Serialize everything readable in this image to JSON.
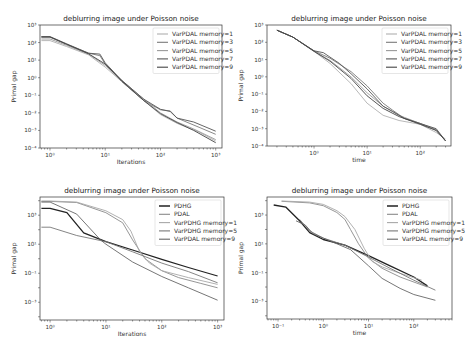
{
  "figure": {
    "width": 466,
    "height": 352
  },
  "chart_data": [
    {
      "id": "top-left",
      "type": "line",
      "title": "deblurring image under Poisson noise",
      "xlabel": "Iterations",
      "ylabel": "Primal gap",
      "xscale": "log",
      "yscale": "log",
      "xlim": [
        0.66,
        1300
      ],
      "ylim": [
        0.0001,
        1000
      ],
      "xticks": [
        {
          "v": 1,
          "label": "10⁰"
        },
        {
          "v": 10,
          "label": "10¹"
        },
        {
          "v": 100,
          "label": "10²"
        },
        {
          "v": 1000,
          "label": "10³"
        }
      ],
      "yticks": [
        {
          "v": 1000,
          "label": "10³"
        },
        {
          "v": 100,
          "label": "10²"
        },
        {
          "v": 10,
          "label": "10¹"
        },
        {
          "v": 1,
          "label": "10⁰"
        },
        {
          "v": 0.1,
          "label": "10⁻¹"
        },
        {
          "v": 0.01,
          "label": "10⁻²"
        },
        {
          "v": 0.001,
          "label": "10⁻³"
        },
        {
          "v": 0.0001,
          "label": "10⁻⁴"
        }
      ],
      "grid": false,
      "legend_position": "upper right",
      "series": [
        {
          "name": "VarPDAL memory=1",
          "color": "#b0b0b0",
          "width": 0.9,
          "x": [
            0.7,
            1,
            2,
            5,
            10,
            20,
            50,
            100,
            200,
            500,
            1000
          ],
          "y": [
            130,
            130,
            60,
            20,
            4,
            0.6,
            0.05,
            0.008,
            0.0025,
            0.0008,
            0.00025
          ]
        },
        {
          "name": "VarPDAL memory=3",
          "color": "#7a7a7a",
          "width": 0.9,
          "x": [
            0.7,
            1,
            2,
            5,
            8,
            10,
            20,
            50,
            100,
            150,
            200,
            500,
            1000
          ],
          "y": [
            200,
            200,
            80,
            25,
            18,
            6,
            0.6,
            0.05,
            0.015,
            0.013,
            0.005,
            0.0015,
            0.0006
          ]
        },
        {
          "name": "VarPDAL memory=5",
          "color": "#999999",
          "width": 0.9,
          "x": [
            0.7,
            1,
            2,
            5,
            10,
            20,
            50,
            100,
            200,
            400,
            1000
          ],
          "y": [
            160,
            160,
            70,
            22,
            5,
            0.7,
            0.06,
            0.01,
            0.003,
            0.0012,
            0.0003
          ]
        },
        {
          "name": "VarPDAL memory=7",
          "color": "#555555",
          "width": 0.9,
          "x": [
            0.7,
            1,
            2,
            5,
            8,
            10,
            20,
            50,
            100,
            150,
            200,
            400,
            1000
          ],
          "y": [
            220,
            220,
            85,
            25,
            22,
            7,
            0.7,
            0.06,
            0.016,
            0.012,
            0.005,
            0.003,
            0.0009
          ]
        },
        {
          "name": "VarPDAL memory=9",
          "color": "#444444",
          "width": 0.9,
          "x": [
            0.7,
            1,
            2,
            5,
            10,
            20,
            50,
            100,
            200,
            400,
            1000
          ],
          "y": [
            210,
            210,
            80,
            23,
            6,
            0.65,
            0.05,
            0.009,
            0.0028,
            0.001,
            0.0002
          ]
        }
      ]
    },
    {
      "id": "top-right",
      "type": "line",
      "title": "deblurring image under Poisson noise",
      "xlabel": "time",
      "ylabel": "Primal gap",
      "xscale": "log",
      "yscale": "log",
      "xlim": [
        0.13,
        380
      ],
      "ylim": [
        0.0001,
        1000
      ],
      "xticks": [
        {
          "v": 1,
          "label": "10⁰"
        },
        {
          "v": 10,
          "label": "10¹"
        },
        {
          "v": 100,
          "label": "10²"
        }
      ],
      "yticks": [
        {
          "v": 1000,
          "label": "10³"
        },
        {
          "v": 100,
          "label": "10²"
        },
        {
          "v": 10,
          "label": "10¹"
        },
        {
          "v": 1,
          "label": "10⁰"
        },
        {
          "v": 0.1,
          "label": "10⁻¹"
        },
        {
          "v": 0.01,
          "label": "10⁻²"
        },
        {
          "v": 0.001,
          "label": "10⁻³"
        },
        {
          "v": 0.0001,
          "label": "10⁻⁴"
        }
      ],
      "grid": false,
      "legend_position": "upper right",
      "series": [
        {
          "name": "VarPDAL memory=1",
          "color": "#b0b0b0",
          "width": 0.9,
          "x": [
            0.2,
            0.4,
            1,
            2,
            5,
            10,
            20,
            40,
            100,
            200,
            300
          ],
          "y": [
            500,
            200,
            30,
            6,
            0.4,
            0.03,
            0.006,
            0.003,
            0.0018,
            0.0006,
            0.00025
          ]
        },
        {
          "name": "VarPDAL memory=3",
          "color": "#7a7a7a",
          "width": 0.9,
          "x": [
            0.2,
            0.4,
            1,
            2,
            5,
            10,
            20,
            30,
            50,
            100,
            200,
            300
          ],
          "y": [
            500,
            200,
            32,
            12,
            2,
            0.3,
            0.03,
            0.012,
            0.004,
            0.002,
            0.0008,
            0.0002
          ]
        },
        {
          "name": "VarPDAL memory=5",
          "color": "#999999",
          "width": 0.9,
          "x": [
            0.2,
            0.4,
            1,
            2,
            5,
            10,
            20,
            40,
            100,
            200,
            300
          ],
          "y": [
            500,
            200,
            30,
            9,
            1,
            0.12,
            0.02,
            0.006,
            0.002,
            0.0009,
            0.0002
          ]
        },
        {
          "name": "VarPDAL memory=7",
          "color": "#555555",
          "width": 0.9,
          "x": [
            0.2,
            0.4,
            1,
            1.5,
            3,
            5,
            10,
            20,
            30,
            50,
            100,
            200,
            300
          ],
          "y": [
            500,
            200,
            32,
            25,
            6,
            1.5,
            0.2,
            0.02,
            0.01,
            0.004,
            0.002,
            0.001,
            0.0002
          ]
        },
        {
          "name": "VarPDAL memory=9",
          "color": "#444444",
          "width": 0.9,
          "x": [
            0.2,
            0.4,
            1,
            2,
            5,
            10,
            20,
            40,
            100,
            200,
            300
          ],
          "y": [
            500,
            200,
            30,
            8,
            0.8,
            0.08,
            0.015,
            0.005,
            0.0018,
            0.0008,
            0.0002
          ]
        }
      ]
    },
    {
      "id": "bottom-left",
      "type": "line",
      "title": "deblurring image under Poisson noise",
      "xlabel": "Iterations",
      "ylabel": "Primal gap",
      "xscale": "log",
      "yscale": "log",
      "xlim": [
        0.66,
        1300
      ],
      "ylim": [
        6e-05,
        18000
      ],
      "xticks": [
        {
          "v": 1,
          "label": "10⁰"
        },
        {
          "v": 10,
          "label": "10¹"
        },
        {
          "v": 100,
          "label": "10²"
        },
        {
          "v": 1000,
          "label": "10³"
        }
      ],
      "yticks": [
        {
          "v": 1000,
          "label": "10³"
        },
        {
          "v": 10,
          "label": "10¹"
        },
        {
          "v": 0.1,
          "label": "10⁻¹"
        },
        {
          "v": 0.001,
          "label": "10⁻³"
        }
      ],
      "grid": false,
      "legend_position": "upper right",
      "series": [
        {
          "name": "PDHG",
          "color": "#222222",
          "width": 1.3,
          "x": [
            0.7,
            1,
            2,
            4,
            10,
            30,
            100,
            300,
            1000
          ],
          "y": [
            3000,
            3000,
            1500,
            60,
            15,
            4,
            0.9,
            0.25,
            0.065
          ]
        },
        {
          "name": "PDAL",
          "color": "#8a8a8a",
          "width": 0.9,
          "x": [
            0.7,
            1,
            3,
            10,
            20,
            30,
            50,
            100,
            200,
            500,
            1000
          ],
          "y": [
            9000,
            9000,
            7500,
            1500,
            300,
            20,
            1,
            0.15,
            0.05,
            0.02,
            0.01
          ]
        },
        {
          "name": "VarPDHG memory=1",
          "color": "#a8a8a8",
          "width": 0.9,
          "x": [
            0.7,
            1,
            3,
            10,
            20,
            28,
            40,
            60,
            100,
            300,
            1000
          ],
          "y": [
            9500,
            9500,
            8000,
            2000,
            500,
            80,
            3,
            0.5,
            0.15,
            0.05,
            0.017
          ]
        },
        {
          "name": "VarPDHG memory=5",
          "color": "#777777",
          "width": 0.9,
          "x": [
            0.7,
            1,
            3,
            10,
            30,
            100,
            300,
            1000
          ],
          "y": [
            150,
            150,
            40,
            15,
            3,
            0.5,
            0.13,
            0.022
          ]
        },
        {
          "name": "VarPDAL memory=9",
          "color": "#666666",
          "width": 0.9,
          "x": [
            0.7,
            1,
            3,
            8,
            10,
            30,
            100,
            300,
            1000
          ],
          "y": [
            8000,
            8000,
            1200,
            20,
            10,
            0.6,
            0.06,
            0.01,
            0.0014
          ]
        }
      ]
    },
    {
      "id": "bottom-right",
      "type": "line",
      "title": "deblurring image under Poisson noise",
      "xlabel": "time",
      "ylabel": "Primal gap",
      "xscale": "log",
      "yscale": "log",
      "xlim": [
        0.057,
        700
      ],
      "ylim": [
        6e-05,
        18000
      ],
      "xticks": [
        {
          "v": 0.1,
          "label": "10⁻¹"
        },
        {
          "v": 1,
          "label": "10⁰"
        },
        {
          "v": 10,
          "label": "10¹"
        },
        {
          "v": 100,
          "label": "10²"
        }
      ],
      "yticks": [
        {
          "v": 1000,
          "label": "10³"
        },
        {
          "v": 10,
          "label": "10¹"
        },
        {
          "v": 0.1,
          "label": "10⁻¹"
        },
        {
          "v": 0.001,
          "label": "10⁻³"
        }
      ],
      "grid": false,
      "legend_position": "upper right",
      "series": [
        {
          "name": "PDHG",
          "color": "#222222",
          "width": 1.3,
          "x": [
            0.08,
            0.15,
            0.3,
            0.5,
            1,
            3,
            10,
            30,
            100,
            200
          ],
          "y": [
            5000,
            3500,
            400,
            60,
            20,
            8,
            1.5,
            0.3,
            0.05,
            0.012
          ]
        },
        {
          "name": "PDAL",
          "color": "#8a8a8a",
          "width": 0.9,
          "x": [
            0.12,
            0.5,
            1,
            2,
            3,
            4,
            6,
            10,
            20,
            50,
            200
          ],
          "y": [
            9000,
            7000,
            4500,
            1500,
            500,
            100,
            10,
            1,
            0.2,
            0.05,
            0.01
          ]
        },
        {
          "name": "VarPDHG memory=1",
          "color": "#a8a8a8",
          "width": 0.9,
          "x": [
            0.12,
            0.5,
            1,
            2,
            3,
            5,
            8,
            12,
            20,
            50,
            150
          ],
          "y": [
            9500,
            8000,
            5500,
            2000,
            800,
            100,
            5,
            0.6,
            0.25,
            0.09,
            0.03
          ]
        },
        {
          "name": "VarPDHG memory=5",
          "color": "#777777",
          "width": 0.9,
          "x": [
            0.3,
            0.5,
            1,
            3,
            10,
            30,
            100,
            300
          ],
          "y": [
            500,
            80,
            25,
            8,
            1.2,
            0.2,
            0.03,
            0.006
          ]
        },
        {
          "name": "VarPDAL memory=9",
          "color": "#666666",
          "width": 0.9,
          "x": [
            0.25,
            0.4,
            0.6,
            1,
            2,
            4,
            10,
            20,
            50,
            100,
            300
          ],
          "y": [
            400,
            200,
            50,
            25,
            10,
            4,
            0.3,
            0.04,
            0.008,
            0.003,
            0.0012
          ]
        }
      ]
    }
  ],
  "panels": [
    {
      "box": [
        40,
        25,
        222,
        148
      ]
    },
    {
      "box": [
        267,
        25,
        451,
        146
      ]
    },
    {
      "box": [
        40,
        197,
        224,
        320
      ]
    },
    {
      "box": [
        267,
        197,
        452,
        319
      ]
    }
  ]
}
